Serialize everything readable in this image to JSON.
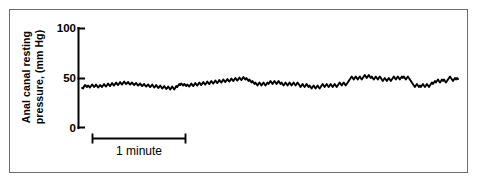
{
  "figure": {
    "background_color": "#ffffff",
    "frame_color": "#6d6d6d",
    "trace_color": "#000000",
    "axis_color": "#000000"
  },
  "axis": {
    "y_label_line1": "Anal canal resting",
    "y_label_line2": "pressure, (mm Hg)",
    "y_ticks": [
      "0",
      "50",
      "100"
    ],
    "tick_100": "100",
    "tick_50": "50",
    "tick_0": "0"
  },
  "scalebar": {
    "caption": "1 minute"
  },
  "chart_data": {
    "type": "line",
    "title": "",
    "subtitle": "",
    "xlabel": "",
    "ylabel": "Anal canal resting pressure, (mm Hg)",
    "xlim": [
      0,
      4.0
    ],
    "ylim": [
      0,
      100
    ],
    "yticks": [
      0,
      50,
      100
    ],
    "xticks": [],
    "grid": false,
    "legend": null,
    "x_units": "minutes",
    "y_units": "mm Hg",
    "annotations": [
      {
        "text": "1 minute",
        "type": "scale-bar",
        "x_start": 0.13,
        "x_end": 1.13,
        "y": -12
      }
    ],
    "series": [
      {
        "name": "Anal canal resting pressure",
        "color": "#000000",
        "linewidth": 1.9,
        "x": [
          0.0,
          0.011,
          0.021,
          0.032,
          0.043,
          0.053,
          0.064,
          0.075,
          0.085,
          0.096,
          0.107,
          0.117,
          0.128,
          0.139,
          0.149,
          0.16,
          0.171,
          0.181,
          0.192,
          0.203,
          0.213,
          0.224,
          0.235,
          0.245,
          0.256,
          0.267,
          0.277,
          0.288,
          0.299,
          0.309,
          0.32,
          0.331,
          0.341,
          0.352,
          0.363,
          0.373,
          0.384,
          0.395,
          0.405,
          0.416,
          0.427,
          0.437,
          0.448,
          0.459,
          0.469,
          0.48,
          0.491,
          0.501,
          0.512,
          0.523,
          0.533,
          0.544,
          0.555,
          0.565,
          0.576,
          0.587,
          0.597,
          0.608,
          0.619,
          0.629,
          0.64,
          0.651,
          0.661,
          0.672,
          0.683,
          0.693,
          0.704,
          0.715,
          0.725,
          0.736,
          0.747,
          0.757,
          0.768,
          0.779,
          0.789,
          0.8,
          0.811,
          0.821,
          0.832,
          0.843,
          0.853,
          0.864,
          0.875,
          0.885,
          0.896,
          0.907,
          0.917,
          0.928,
          0.939,
          0.949,
          0.96,
          0.971,
          0.981,
          0.992,
          1.003,
          1.013,
          1.024,
          1.035,
          1.045,
          1.056,
          1.067,
          1.077,
          1.088,
          1.099,
          1.109,
          1.12,
          1.131,
          1.141,
          1.152,
          1.163,
          1.173,
          1.184,
          1.195,
          1.205,
          1.216,
          1.227,
          1.237,
          1.248,
          1.259,
          1.269,
          1.28,
          1.291,
          1.301,
          1.312,
          1.323,
          1.333,
          1.344,
          1.355,
          1.365,
          1.376,
          1.387,
          1.397,
          1.408,
          1.419,
          1.429,
          1.44,
          1.451,
          1.461,
          1.472,
          1.483,
          1.493,
          1.504,
          1.515,
          1.525,
          1.536,
          1.547,
          1.557,
          1.568,
          1.579,
          1.589,
          1.6,
          1.611,
          1.621,
          1.632,
          1.643,
          1.653,
          1.664,
          1.675,
          1.685,
          1.696,
          1.707,
          1.717,
          1.728,
          1.739,
          1.749,
          1.76,
          1.771,
          1.781,
          1.792,
          1.803,
          1.813,
          1.824,
          1.835,
          1.845,
          1.856,
          1.867,
          1.877,
          1.888,
          1.899,
          1.909,
          1.92,
          1.931,
          1.941,
          1.952,
          1.963,
          1.973,
          1.984,
          1.995,
          2.005,
          2.016,
          2.027,
          2.037,
          2.048,
          2.059,
          2.069,
          2.08,
          2.091,
          2.101,
          2.112,
          2.123,
          2.133,
          2.144,
          2.155,
          2.165,
          2.176,
          2.187,
          2.197,
          2.208,
          2.219,
          2.229,
          2.24,
          2.251,
          2.261,
          2.272,
          2.283,
          2.293,
          2.304,
          2.315,
          2.325,
          2.336,
          2.347,
          2.357,
          2.368,
          2.379,
          2.389,
          2.4,
          2.411,
          2.421,
          2.432,
          2.443,
          2.453,
          2.464,
          2.475,
          2.485,
          2.496,
          2.507,
          2.517,
          2.528,
          2.539,
          2.549,
          2.56,
          2.571,
          2.581,
          2.592,
          2.603,
          2.613,
          2.624,
          2.635,
          2.645,
          2.656,
          2.667,
          2.677,
          2.688,
          2.699,
          2.709,
          2.72,
          2.731,
          2.741,
          2.752,
          2.763,
          2.773,
          2.784,
          2.795,
          2.805,
          2.816,
          2.827,
          2.837,
          2.848,
          2.859,
          2.869,
          2.88,
          2.891,
          2.901,
          2.912,
          2.923,
          2.933,
          2.944,
          2.955,
          2.965,
          2.976,
          2.987,
          2.997,
          3.008,
          3.019,
          3.029,
          3.04,
          3.051,
          3.061,
          3.072,
          3.083,
          3.093,
          3.104,
          3.115,
          3.125,
          3.136,
          3.147,
          3.157,
          3.168,
          3.179,
          3.189,
          3.2,
          3.211,
          3.221,
          3.232,
          3.243,
          3.253,
          3.264,
          3.275,
          3.285,
          3.296,
          3.307,
          3.317,
          3.328,
          3.339,
          3.349,
          3.36,
          3.371,
          3.381,
          3.392,
          3.403,
          3.413,
          3.424,
          3.435,
          3.445,
          3.456,
          3.467,
          3.477,
          3.488,
          3.499,
          3.509,
          3.52,
          3.531,
          3.541,
          3.552,
          3.563,
          3.573,
          3.584,
          3.595,
          3.605,
          3.616,
          3.627,
          3.637,
          3.648,
          3.659,
          3.669,
          3.68,
          3.691,
          3.701,
          3.712,
          3.723,
          3.733,
          3.744,
          3.755,
          3.765,
          3.776,
          3.787,
          3.797,
          3.808,
          3.819,
          3.829,
          3.84,
          3.851,
          3.861,
          3.872,
          3.883,
          3.893,
          3.904,
          3.915,
          3.925,
          3.936,
          3.947,
          3.957,
          3.968,
          3.979,
          3.989,
          4.0
        ],
        "y": [
          40.0,
          39.5,
          41.5,
          43.0,
          42.0,
          41.0,
          42.5,
          41.5,
          40.5,
          42.0,
          43.5,
          42.5,
          41.0,
          42.0,
          43.5,
          42.0,
          40.5,
          41.5,
          43.0,
          42.0,
          41.0,
          42.5,
          44.0,
          42.5,
          41.5,
          43.0,
          44.5,
          43.0,
          42.0,
          43.5,
          45.0,
          43.5,
          42.5,
          44.0,
          45.5,
          44.0,
          43.0,
          44.5,
          46.0,
          44.5,
          43.5,
          45.0,
          46.5,
          45.0,
          44.0,
          45.0,
          46.0,
          44.5,
          43.5,
          44.5,
          45.5,
          44.0,
          43.0,
          44.0,
          45.0,
          43.5,
          42.5,
          43.5,
          44.5,
          43.0,
          42.0,
          43.0,
          44.0,
          42.5,
          41.5,
          42.5,
          43.5,
          42.0,
          41.0,
          42.0,
          43.5,
          42.0,
          40.5,
          41.5,
          43.0,
          41.5,
          40.0,
          41.0,
          42.5,
          41.0,
          39.5,
          40.5,
          42.0,
          40.5,
          39.0,
          40.0,
          41.5,
          40.0,
          38.5,
          40.0,
          41.5,
          40.0,
          38.5,
          40.0,
          42.0,
          41.0,
          42.5,
          44.0,
          43.0,
          44.5,
          43.5,
          42.5,
          44.0,
          43.0,
          42.0,
          43.5,
          42.5,
          41.5,
          43.0,
          44.5,
          43.0,
          42.0,
          43.5,
          45.0,
          43.5,
          42.5,
          44.0,
          45.5,
          44.0,
          43.0,
          44.5,
          46.0,
          44.5,
          43.5,
          45.0,
          46.5,
          45.0,
          44.0,
          45.5,
          47.0,
          45.5,
          44.5,
          46.0,
          47.5,
          46.0,
          45.0,
          46.5,
          48.0,
          46.5,
          45.5,
          47.0,
          48.5,
          47.0,
          46.0,
          47.5,
          49.0,
          47.5,
          46.5,
          48.0,
          49.5,
          48.0,
          47.0,
          48.5,
          50.0,
          48.5,
          47.5,
          49.0,
          50.5,
          49.0,
          48.0,
          49.5,
          51.0,
          49.5,
          48.5,
          50.0,
          48.5,
          47.0,
          48.5,
          47.0,
          45.5,
          47.0,
          45.5,
          44.0,
          45.5,
          44.0,
          42.5,
          44.0,
          45.5,
          44.0,
          42.5,
          44.0,
          45.5,
          44.0,
          42.5,
          44.0,
          45.5,
          44.0,
          45.5,
          47.0,
          45.5,
          44.0,
          45.5,
          47.0,
          45.5,
          44.0,
          45.5,
          47.0,
          45.5,
          44.0,
          45.5,
          44.0,
          42.5,
          44.0,
          45.5,
          44.0,
          42.5,
          44.0,
          45.5,
          44.0,
          42.5,
          44.0,
          45.5,
          44.0,
          42.5,
          44.0,
          45.5,
          44.0,
          42.5,
          41.0,
          42.5,
          44.0,
          42.5,
          41.0,
          42.5,
          44.0,
          42.5,
          41.0,
          42.5,
          41.0,
          39.5,
          41.0,
          42.5,
          41.0,
          39.5,
          41.0,
          42.5,
          41.0,
          39.5,
          41.0,
          42.5,
          44.0,
          42.5,
          41.0,
          42.5,
          44.0,
          42.5,
          41.0,
          42.5,
          44.0,
          42.5,
          41.0,
          42.5,
          44.0,
          42.5,
          41.0,
          42.5,
          44.0,
          45.5,
          44.0,
          42.5,
          44.0,
          45.5,
          44.0,
          42.5,
          44.0,
          45.5,
          47.0,
          48.5,
          50.0,
          51.5,
          50.0,
          48.5,
          50.0,
          51.5,
          50.0,
          48.5,
          50.0,
          51.5,
          50.0,
          48.5,
          50.0,
          51.5,
          53.0,
          51.5,
          50.0,
          51.5,
          53.0,
          51.5,
          50.0,
          51.5,
          50.0,
          48.5,
          50.0,
          51.5,
          50.0,
          48.5,
          50.0,
          51.5,
          50.0,
          48.5,
          47.0,
          48.5,
          50.0,
          48.5,
          47.0,
          48.5,
          50.0,
          48.5,
          47.0,
          48.5,
          50.0,
          51.5,
          50.0,
          48.5,
          50.0,
          51.5,
          50.0,
          48.5,
          50.0,
          51.5,
          50.0,
          51.5,
          50.0,
          48.5,
          50.0,
          51.5,
          50.0,
          48.5,
          47.0,
          45.5,
          44.0,
          42.5,
          41.0,
          42.5,
          44.0,
          42.5,
          41.0,
          42.5,
          41.0,
          42.5,
          44.0,
          42.5,
          41.0,
          42.5,
          44.0,
          42.5,
          41.0,
          42.5,
          44.0,
          45.5,
          44.0,
          45.5,
          47.0,
          45.5,
          47.0,
          48.5,
          47.0,
          45.5,
          47.0,
          48.5,
          47.0,
          48.5,
          47.0,
          45.5,
          47.0,
          48.5,
          50.0,
          51.5,
          50.0,
          48.5,
          47.0,
          48.5,
          50.0,
          48.5,
          50.0,
          49.0
        ]
      }
    ]
  }
}
